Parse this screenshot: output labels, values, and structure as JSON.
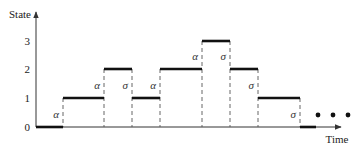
{
  "diagram": {
    "type": "step-state-timeline",
    "y_axis_label": "State",
    "x_axis_label": "Time",
    "y_ticks": [
      "0",
      "1",
      "2",
      "3"
    ],
    "continuation": "• • •",
    "colors": {
      "line": "#111111",
      "axis": "#333333",
      "dash": "#555555"
    },
    "segments": [
      {
        "state": 0,
        "x0": 36,
        "x1": 63
      },
      {
        "state": 1,
        "x0": 63,
        "x1": 104
      },
      {
        "state": 2,
        "x0": 104,
        "x1": 132
      },
      {
        "state": 1,
        "x0": 132,
        "x1": 160
      },
      {
        "state": 2,
        "x0": 160,
        "x1": 202
      },
      {
        "state": 3,
        "x0": 202,
        "x1": 230
      },
      {
        "state": 2,
        "x0": 230,
        "x1": 258
      },
      {
        "state": 1,
        "x0": 258,
        "x1": 300
      },
      {
        "state": 0,
        "x0": 300,
        "x1": 316
      }
    ],
    "transitions": [
      {
        "x": 63,
        "from": 0,
        "to": 1,
        "label": "α"
      },
      {
        "x": 104,
        "from": 1,
        "to": 2,
        "label": "α"
      },
      {
        "x": 132,
        "from": 2,
        "to": 1,
        "label": "σ"
      },
      {
        "x": 160,
        "from": 1,
        "to": 2,
        "label": "α"
      },
      {
        "x": 202,
        "from": 2,
        "to": 3,
        "label": "α"
      },
      {
        "x": 230,
        "from": 3,
        "to": 2,
        "label": "σ"
      },
      {
        "x": 258,
        "from": 2,
        "to": 1,
        "label": "σ"
      },
      {
        "x": 300,
        "from": 1,
        "to": 0,
        "label": "σ"
      }
    ]
  },
  "chart_data": {
    "type": "line",
    "title": "",
    "xlabel": "Time",
    "ylabel": "State",
    "y_ticks": [
      0,
      1,
      2,
      3
    ],
    "ylim": [
      0,
      3
    ],
    "grid": false,
    "series": [
      {
        "name": "state",
        "step": true,
        "values": [
          0,
          1,
          2,
          1,
          2,
          3,
          2,
          1,
          0
        ]
      }
    ],
    "transition_labels": [
      "α",
      "α",
      "σ",
      "α",
      "α",
      "σ",
      "σ",
      "σ"
    ],
    "annotations": [
      "α = arrival (state +1)",
      "σ = service (state −1)",
      "• • • continuation"
    ]
  }
}
